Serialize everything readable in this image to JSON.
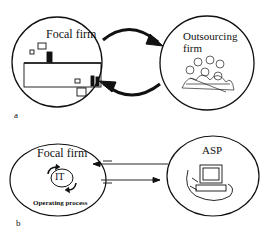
{
  "panel_a": {
    "label": "a",
    "focal_firm_label": "Focal firm",
    "outsourcing_firm_label_line1": "Outsourcing",
    "outsourcing_firm_label_line2": "firm",
    "icons": [
      "office-workers-icon",
      "crowd-of-people-icon"
    ],
    "connector": "curved-bidirectional-arrows"
  },
  "panel_b": {
    "label": "b",
    "focal_firm_label": "Focal firm",
    "it_label": "IT",
    "process_label": "Operating process",
    "asp_label": "ASP",
    "icons": [
      "cycle-arrows-icon",
      "computer-icon"
    ],
    "connector": "two-straight-arrows-opposite-directions"
  },
  "colors": {
    "ink": "#111111",
    "background": "#ffffff"
  }
}
